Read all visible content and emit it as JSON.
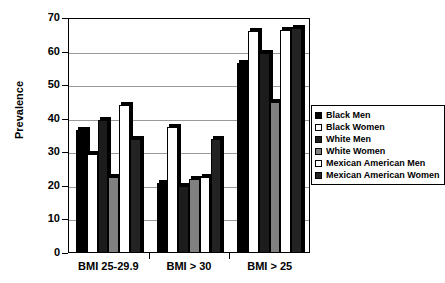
{
  "chart_data": {
    "type": "bar",
    "title": "",
    "xlabel": "",
    "ylabel": "Prevalence",
    "ylim": [
      0,
      70
    ],
    "ytick_interval": 10,
    "yticks": [
      0,
      10,
      20,
      30,
      40,
      50,
      60,
      70
    ],
    "grid": true,
    "legend_position": "right",
    "categories": [
      "BMI 25-29.9",
      "BMI > 30",
      "BMI > 25"
    ],
    "series": [
      {
        "name": "Black Men",
        "fill": "solid-black",
        "color": "#000000",
        "values": [
          36.5,
          21.0,
          56.5
        ]
      },
      {
        "name": "Black Women",
        "fill": "white",
        "color": "#ffffff",
        "values": [
          29.5,
          37.5,
          66.0
        ]
      },
      {
        "name": "White Men",
        "fill": "solid-darkest",
        "color": "#1c1c1c",
        "values": [
          39.5,
          20.0,
          59.5
        ]
      },
      {
        "name": "White Women",
        "fill": "gray",
        "color": "#808080",
        "values": [
          22.5,
          22.0,
          45.0
        ]
      },
      {
        "name": "Mexican American Men",
        "fill": "white",
        "color": "#ffffff",
        "values": [
          44.0,
          22.5,
          66.5
        ]
      },
      {
        "name": "Mexican American Women",
        "fill": "solid-dark",
        "color": "#232323",
        "values": [
          34.0,
          34.0,
          67.0
        ]
      }
    ]
  },
  "axis": {
    "y_title": "Prevalence"
  }
}
